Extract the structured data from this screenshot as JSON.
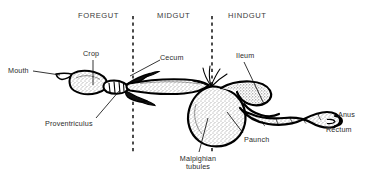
{
  "figure": {
    "background_color": "#ffffff",
    "ink_color": "#000000",
    "text_color": "#2b2b2b",
    "width": 365,
    "height": 184
  },
  "regions": [
    {
      "name": "foregut",
      "label": "FOREGUT",
      "x": 78,
      "y": 12
    },
    {
      "name": "midgut",
      "label": "MIDGUT",
      "x": 157,
      "y": 12
    },
    {
      "name": "hindgut",
      "label": "HINDGUT",
      "x": 228,
      "y": 12
    }
  ],
  "dividers": [
    {
      "name": "foregut-midgut-divider",
      "x": 133,
      "y1": 16,
      "y2": 152
    },
    {
      "name": "midgut-hindgut-divider",
      "x": 212,
      "y1": 16,
      "y2": 152
    }
  ],
  "parts": [
    {
      "name": "mouth",
      "label": "Mouth",
      "x": 8,
      "y": 68
    },
    {
      "name": "crop",
      "label": "Crop",
      "x": 83,
      "y": 50
    },
    {
      "name": "proventriculus",
      "label": "Proventriculus",
      "x": 45,
      "y": 122
    },
    {
      "name": "cecum",
      "label": "Cecum",
      "x": 162,
      "y": 55
    },
    {
      "name": "malpighian-tubules",
      "label": "Malpighian",
      "label2": "tubules",
      "x": 172,
      "y": 158
    },
    {
      "name": "ileum",
      "label": "Ileum",
      "x": 236,
      "y": 53
    },
    {
      "name": "paunch",
      "label": "Paunch",
      "x": 243,
      "y": 138
    },
    {
      "name": "anus",
      "label": "Anus",
      "x": 338,
      "y": 110
    },
    {
      "name": "rectum",
      "label": "Rectum",
      "x": 326,
      "y": 125
    }
  ]
}
